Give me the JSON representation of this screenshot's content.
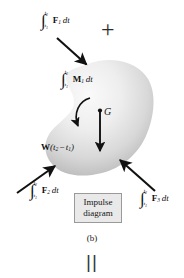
{
  "figure": {
    "title": "Impulse diagram",
    "caption": "(b)",
    "equals_bars": "||",
    "plus_sign": "+",
    "background": "#ffffff",
    "body_fill_light": "#f2f2f2",
    "body_fill_dark": "#b9b9b9",
    "stroke": "#222222"
  },
  "box": {
    "line1": "Impulse",
    "line2": "diagram",
    "fill": "#e9e9e9",
    "border": "#9a9a9a"
  },
  "labels": {
    "f1": {
      "integral": "∫",
      "lower": "t1",
      "upper": "t2",
      "vector": "F",
      "sub": "1",
      "dt": "dt"
    },
    "f2": {
      "integral": "∫",
      "lower": "t1",
      "upper": "t2",
      "vector": "F",
      "sub": "2",
      "dt": "dt"
    },
    "f3": {
      "integral": "∫",
      "lower": "t1",
      "upper": "t2",
      "vector": "F",
      "sub": "3",
      "dt": "dt"
    },
    "m1": {
      "integral": "∫",
      "lower": "t1",
      "upper": "t2",
      "vector": "M",
      "sub": "1",
      "dt": "dt"
    },
    "weight": {
      "vector": "W",
      "expr": "(t2 − t1)"
    },
    "center_of_mass": "G"
  },
  "arrows": [
    {
      "name": "f1-impulse-arrow",
      "from": [
        57,
        38
      ],
      "to": [
        88,
        66
      ],
      "direction": "down-right"
    },
    {
      "name": "f2-impulse-arrow",
      "from": [
        18,
        192
      ],
      "to": [
        56,
        165
      ],
      "direction": "up-right"
    },
    {
      "name": "f3-impulse-arrow",
      "from": [
        154,
        190
      ],
      "to": [
        120,
        160
      ],
      "direction": "up-left"
    },
    {
      "name": "weight-impulse-arrow",
      "from": [
        100,
        111
      ],
      "to": [
        100,
        154
      ],
      "direction": "down"
    },
    {
      "name": "moment-arrow",
      "type": "curved",
      "direction": "clockwise-down-left"
    }
  ],
  "subscripts": {
    "t1": "t",
    "t1n": "1",
    "t2": "t",
    "t2n": "2"
  }
}
